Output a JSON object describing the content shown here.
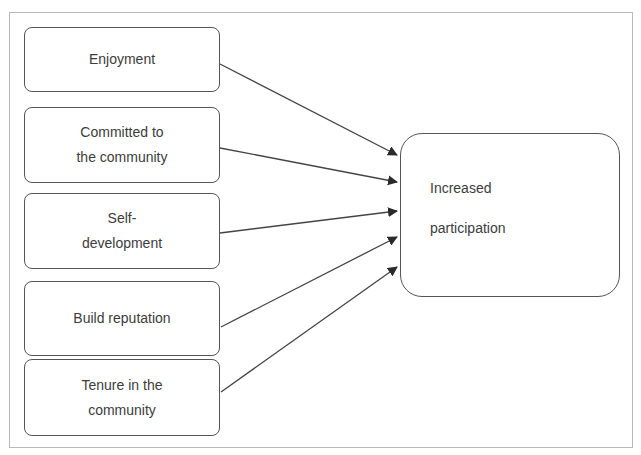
{
  "diagram": {
    "type": "flow",
    "factors": [
      {
        "id": "enjoyment",
        "label": "Enjoyment"
      },
      {
        "id": "committed",
        "label": "Committed to\nthe community"
      },
      {
        "id": "self-development",
        "label": "Self-\ndevelopment"
      },
      {
        "id": "build-reputation",
        "label": "Build reputation"
      },
      {
        "id": "tenure",
        "label": "Tenure in the\ncommunity"
      }
    ],
    "outcome": {
      "id": "increased-participation",
      "line1": "Increased",
      "line2": "participation"
    },
    "edges": [
      {
        "from": "enjoyment",
        "to": "increased-participation"
      },
      {
        "from": "committed",
        "to": "increased-participation"
      },
      {
        "from": "self-development",
        "to": "increased-participation"
      },
      {
        "from": "build-reputation",
        "to": "increased-participation"
      },
      {
        "from": "tenure",
        "to": "increased-participation"
      }
    ],
    "colors": {
      "stroke": "#555555",
      "arrow": "#2a2a2a",
      "frame": "#b9b9b9",
      "text": "#3c3c3c"
    }
  }
}
